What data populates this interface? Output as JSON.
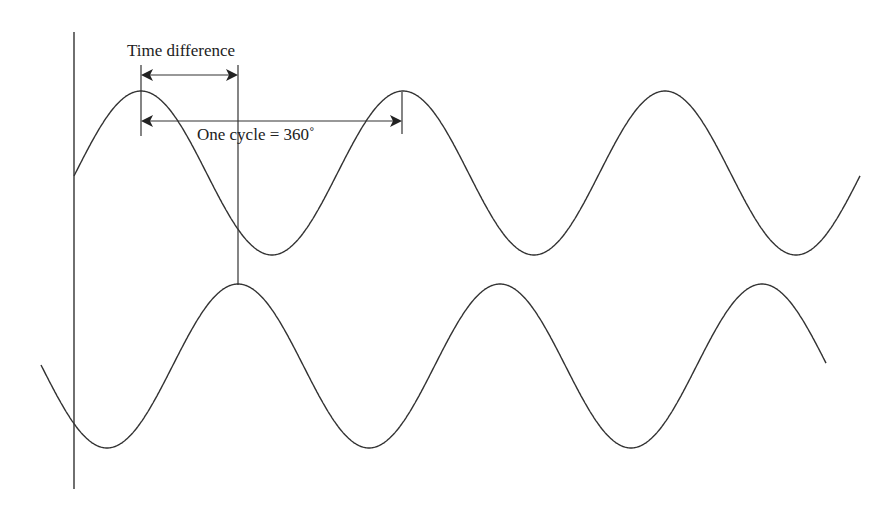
{
  "diagram": {
    "labels": {
      "time_difference": "Time difference",
      "one_cycle": "One cycle = 360˚"
    },
    "colors": {
      "line": "#333333",
      "text": "#222222",
      "background": "#ffffff"
    },
    "waves": [
      {
        "name": "reference-wave",
        "center_y": 173,
        "amplitude": 82,
        "period": 262,
        "peak_x": 141,
        "x_start": 74,
        "x_end": 860
      },
      {
        "name": "lagging-wave",
        "center_y": 366,
        "amplitude": 82,
        "period": 262,
        "peak_x": 238,
        "x_start": 41,
        "x_end": 826
      }
    ],
    "axis": {
      "x": 74,
      "y_top": 32,
      "y_bottom": 489
    },
    "phase_marker_x": 238,
    "cycle_end_x": 402
  }
}
